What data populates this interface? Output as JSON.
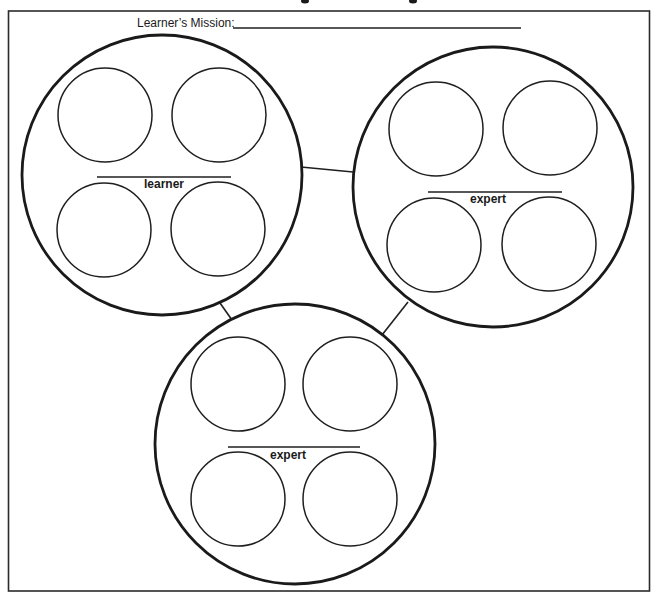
{
  "worksheet": {
    "mission_label": "Learner’s Mission:",
    "mission_value": "",
    "groups": [
      {
        "id": "learner",
        "role_label": "learner",
        "center": [
          162,
          175
        ],
        "radius": 140,
        "slots": [
          {
            "position": "top-left",
            "center": [
              105,
              115
            ],
            "value": ""
          },
          {
            "position": "top-right",
            "center": [
              219,
              115
            ],
            "value": ""
          },
          {
            "position": "bottom-left",
            "center": [
              104,
              230
            ],
            "value": ""
          },
          {
            "position": "bottom-right",
            "center": [
              218,
              229
            ],
            "value": ""
          }
        ],
        "label_line": {
          "x1": 97,
          "x2": 231,
          "y": 177
        },
        "label_pos": [
          164,
          188
        ]
      },
      {
        "id": "expert-1",
        "role_label": "expert",
        "center": [
          493,
          187
        ],
        "radius": 140,
        "slots": [
          {
            "position": "top-left",
            "center": [
              436,
              129
            ],
            "value": ""
          },
          {
            "position": "top-right",
            "center": [
              550,
              128
            ],
            "value": ""
          },
          {
            "position": "bottom-left",
            "center": [
              434,
              245
            ],
            "value": ""
          },
          {
            "position": "bottom-right",
            "center": [
              549,
              244
            ],
            "value": ""
          }
        ],
        "label_line": {
          "x1": 428,
          "x2": 562,
          "y": 192
        },
        "label_pos": [
          488,
          203
        ]
      },
      {
        "id": "expert-2",
        "role_label": "expert",
        "center": [
          295,
          444
        ],
        "radius": 140,
        "slots": [
          {
            "position": "top-left",
            "center": [
              238,
              384
            ],
            "value": ""
          },
          {
            "position": "top-right",
            "center": [
              350,
              384
            ],
            "value": ""
          },
          {
            "position": "bottom-left",
            "center": [
              238,
              499
            ],
            "value": ""
          },
          {
            "position": "bottom-right",
            "center": [
              350,
              499
            ],
            "value": ""
          }
        ],
        "label_line": {
          "x1": 228,
          "x2": 360,
          "y": 447
        },
        "label_pos": [
          288,
          459
        ]
      }
    ],
    "connectors": [
      {
        "from": "learner",
        "to": "expert-1"
      },
      {
        "from": "learner",
        "to": "expert-2"
      },
      {
        "from": "expert-1",
        "to": "expert-2"
      }
    ]
  },
  "colors": {
    "ink": "#1a1a1a",
    "paper": "#ffffff"
  }
}
